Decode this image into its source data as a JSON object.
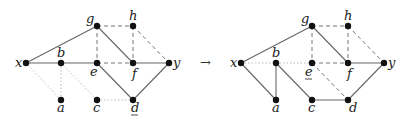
{
  "arrow": "→",
  "graphs": [
    {
      "name": "before",
      "offset_x": 0,
      "underlined": "d",
      "nodes": {
        "x": {
          "x": 26,
          "y": 63,
          "label": "x",
          "lx": -11,
          "ly": 4
        },
        "b": {
          "x": 61,
          "y": 63,
          "label": "b",
          "lx": -4,
          "ly": -6
        },
        "g": {
          "x": 97,
          "y": 26,
          "label": "g",
          "lx": -11,
          "ly": -3
        },
        "h": {
          "x": 133,
          "y": 26,
          "label": "h",
          "lx": -4,
          "ly": -6
        },
        "e": {
          "x": 97,
          "y": 63,
          "label": "e",
          "lx": -7,
          "ly": 13
        },
        "f": {
          "x": 133,
          "y": 63,
          "label": "f",
          "lx": -1,
          "ly": 15
        },
        "y": {
          "x": 169,
          "y": 63,
          "label": "y",
          "lx": 4,
          "ly": 4
        },
        "a": {
          "x": 61,
          "y": 100,
          "label": "a",
          "lx": -4,
          "ly": 12
        },
        "c": {
          "x": 97,
          "y": 100,
          "label": "c",
          "lx": -4,
          "ly": 12
        },
        "d": {
          "x": 133,
          "y": 100,
          "label": "d",
          "lx": -2,
          "ly": 12
        }
      },
      "edges": [
        [
          "x",
          "g",
          "solid"
        ],
        [
          "x",
          "b",
          "solid"
        ],
        [
          "b",
          "e",
          "solid"
        ],
        [
          "g",
          "f",
          "solid"
        ],
        [
          "e",
          "d",
          "solid"
        ],
        [
          "f",
          "y",
          "solid"
        ],
        [
          "d",
          "y",
          "solid"
        ],
        [
          "g",
          "h",
          "dashed"
        ],
        [
          "g",
          "e",
          "dashed"
        ],
        [
          "e",
          "f",
          "dashed"
        ],
        [
          "h",
          "f",
          "dashed"
        ],
        [
          "h",
          "y",
          "dashed"
        ],
        [
          "x",
          "a",
          "dotted"
        ],
        [
          "b",
          "a",
          "dotted"
        ],
        [
          "b",
          "c",
          "dotted"
        ],
        [
          "c",
          "d",
          "dotted"
        ]
      ]
    },
    {
      "name": "after",
      "offset_x": 215,
      "underlined": "e",
      "nodes": {
        "x": {
          "x": 26,
          "y": 63,
          "label": "x",
          "lx": -11,
          "ly": 4
        },
        "b": {
          "x": 61,
          "y": 63,
          "label": "b",
          "lx": -4,
          "ly": -6
        },
        "g": {
          "x": 97,
          "y": 26,
          "label": "g",
          "lx": -11,
          "ly": -3
        },
        "h": {
          "x": 133,
          "y": 26,
          "label": "h",
          "lx": -4,
          "ly": -6
        },
        "e": {
          "x": 97,
          "y": 63,
          "label": "e",
          "lx": -7,
          "ly": 13
        },
        "f": {
          "x": 133,
          "y": 63,
          "label": "f",
          "lx": -1,
          "ly": 15
        },
        "y": {
          "x": 169,
          "y": 63,
          "label": "y",
          "lx": 4,
          "ly": 4
        },
        "a": {
          "x": 61,
          "y": 100,
          "label": "a",
          "lx": -4,
          "ly": 12
        },
        "c": {
          "x": 97,
          "y": 100,
          "label": "c",
          "lx": -4,
          "ly": 12
        },
        "d": {
          "x": 133,
          "y": 100,
          "label": "d",
          "lx": 1,
          "ly": 12
        }
      },
      "edges": [
        [
          "x",
          "g",
          "solid"
        ],
        [
          "g",
          "f",
          "solid"
        ],
        [
          "f",
          "y",
          "solid"
        ],
        [
          "d",
          "y",
          "solid"
        ],
        [
          "x",
          "a",
          "solid"
        ],
        [
          "b",
          "a",
          "solid"
        ],
        [
          "b",
          "c",
          "solid"
        ],
        [
          "c",
          "d",
          "solid"
        ],
        [
          "g",
          "h",
          "dashed"
        ],
        [
          "g",
          "e",
          "dashed"
        ],
        [
          "e",
          "f",
          "dashed"
        ],
        [
          "h",
          "f",
          "dashed"
        ],
        [
          "h",
          "y",
          "dashed"
        ],
        [
          "e",
          "d",
          "dashed"
        ],
        [
          "x",
          "b",
          "dotted"
        ],
        [
          "b",
          "e",
          "dotted"
        ]
      ]
    }
  ]
}
